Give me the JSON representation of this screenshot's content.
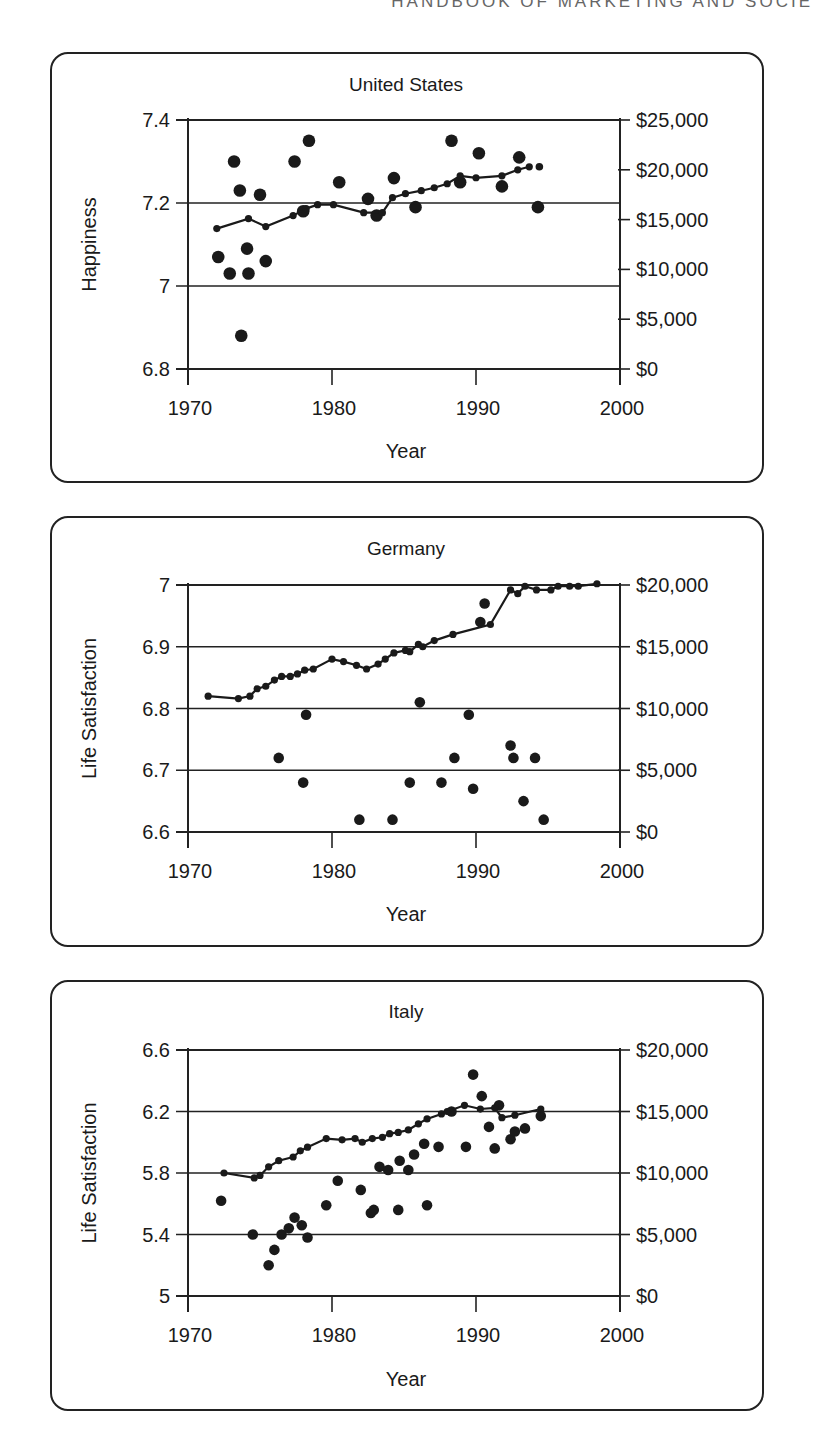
{
  "page": {
    "running_head": "HANDBOOK OF MARKETING AND SOCIE"
  },
  "chart_data": [
    {
      "type": "scatter",
      "title": "United States",
      "xlabel": "Year",
      "ylabel": "Happiness",
      "y2label": "",
      "xlim": [
        1970,
        2000
      ],
      "ylim": [
        6.8,
        7.4
      ],
      "y2lim": [
        0,
        25000
      ],
      "x_ticks": [
        "1970",
        "1980",
        "1990",
        "2000"
      ],
      "y_ticks": [
        "6.8",
        "7",
        "7.2",
        "7.4"
      ],
      "y2_ticks": [
        "$0",
        "$5,000",
        "$10,000",
        "$15,000",
        "$20,000",
        "$25,000"
      ],
      "grid": "horizontal at left-axis ticks",
      "series": [
        {
          "name": "Happiness (survey)",
          "kind": "scatter",
          "axis": "left",
          "x": [
            1972.1,
            1972.9,
            1973.2,
            1973.6,
            1973.7,
            1974.1,
            1974.2,
            1975.0,
            1975.4,
            1977.4,
            1978.0,
            1978.4,
            1980.5,
            1982.5,
            1983.1,
            1984.3,
            1985.8,
            1988.3,
            1988.9,
            1990.2,
            1991.8,
            1993.0,
            1994.3
          ],
          "y": [
            7.07,
            7.03,
            7.3,
            7.23,
            6.88,
            7.09,
            7.03,
            7.22,
            7.06,
            7.3,
            7.18,
            7.35,
            7.25,
            7.21,
            7.17,
            7.26,
            7.19,
            7.35,
            7.25,
            7.32,
            7.24,
            7.31,
            7.19
          ]
        },
        {
          "name": "GNP per capita",
          "kind": "line",
          "axis": "right",
          "x": [
            1972.0,
            1974.2,
            1975.4,
            1977.3,
            1978.2,
            1979.0,
            1980.1,
            1982.2,
            1983.5,
            1984.2,
            1985.1,
            1986.2,
            1987.1,
            1988.0,
            1988.9,
            1990.0,
            1991.8,
            1992.9,
            1993.7
          ],
          "y": [
            14100,
            15100,
            14300,
            15400,
            16100,
            16500,
            16500,
            15700,
            15700,
            17200,
            17600,
            17900,
            18200,
            18600,
            19400,
            19200,
            19400,
            20000,
            20300
          ]
        },
        {
          "name": "GNP per capita (unconnected point)",
          "kind": "scatter-small",
          "axis": "right",
          "x": [
            1994.4
          ],
          "y": [
            20300
          ]
        }
      ]
    },
    {
      "type": "scatter",
      "title": "Germany",
      "xlabel": "Year",
      "ylabel": "Life Satisfaction",
      "xlim": [
        1970,
        2000
      ],
      "ylim": [
        6.6,
        7.0
      ],
      "y2lim": [
        0,
        20000
      ],
      "x_ticks": [
        "1970",
        "1980",
        "1990",
        "2000"
      ],
      "y_ticks": [
        "6.6",
        "6.7",
        "6.8",
        "6.9",
        "7"
      ],
      "y2_ticks": [
        "$0",
        "$5,000",
        "$10,000",
        "$15,000",
        "$20,000"
      ],
      "grid": "horizontal at left-axis ticks",
      "series": [
        {
          "name": "Life satisfaction (survey)",
          "kind": "scatter",
          "axis": "left",
          "x": [
            1976.3,
            1978.2,
            1978.0,
            1981.9,
            1984.2,
            1985.4,
            1986.1,
            1987.6,
            1988.5,
            1989.5,
            1989.8,
            1990.3,
            1990.6,
            1992.4,
            1992.6,
            1993.3,
            1994.1,
            1994.7
          ],
          "y": [
            6.72,
            6.79,
            6.68,
            6.62,
            6.62,
            6.68,
            6.81,
            6.68,
            6.72,
            6.79,
            6.67,
            6.94,
            6.97,
            6.74,
            6.72,
            6.65,
            6.72,
            6.62
          ]
        },
        {
          "name": "GNP per capita",
          "kind": "line",
          "axis": "right",
          "x": [
            1971.4,
            1973.5,
            1974.3,
            1974.8,
            1975.4,
            1976.0,
            1976.5,
            1977.1,
            1977.6,
            1978.1,
            1978.7,
            1980.0,
            1980.8,
            1981.7,
            1982.4,
            1983.2,
            1983.7,
            1984.3,
            1985.1,
            1985.4,
            1986.0,
            1986.3,
            1987.1,
            1988.4,
            1991.0,
            1992.4,
            1992.9,
            1993.4,
            1994.2,
            1995.2,
            1995.7,
            1996.5,
            1997.1,
            1998.4
          ],
          "y": [
            11000,
            10800,
            11000,
            11600,
            11800,
            12300,
            12600,
            12600,
            12800,
            13100,
            13200,
            14000,
            13800,
            13500,
            13200,
            13600,
            14000,
            14500,
            14700,
            14600,
            15200,
            15000,
            15500,
            16000,
            16800,
            19600,
            19300,
            19900,
            19600,
            19600,
            19900,
            19900,
            19900,
            20100
          ]
        }
      ]
    },
    {
      "type": "scatter",
      "title": "Italy",
      "xlabel": "Year",
      "ylabel": "Life Satisfaction",
      "xlim": [
        1970,
        2000
      ],
      "ylim": [
        5.0,
        6.6
      ],
      "y2lim": [
        0,
        20000
      ],
      "x_ticks": [
        "1970",
        "1980",
        "1990",
        "2000"
      ],
      "y_ticks": [
        "5",
        "5.4",
        "5.8",
        "6.2",
        "6.6"
      ],
      "y2_ticks": [
        "$0",
        "$5,000",
        "$10,000",
        "$15,000",
        "$20,000"
      ],
      "grid": "horizontal at left-axis ticks",
      "series": [
        {
          "name": "Life satisfaction (survey)",
          "kind": "scatter",
          "axis": "left",
          "x": [
            1972.3,
            1974.5,
            1975.6,
            1976.0,
            1976.5,
            1977.0,
            1977.4,
            1977.9,
            1978.3,
            1979.6,
            1980.4,
            1982.0,
            1982.7,
            1982.9,
            1983.3,
            1983.9,
            1984.6,
            1984.7,
            1985.3,
            1985.7,
            1986.4,
            1986.6,
            1987.4,
            1988.3,
            1989.3,
            1989.8,
            1990.4,
            1990.9,
            1991.3,
            1991.6,
            1992.4,
            1992.7,
            1993.4,
            1994.5
          ],
          "y": [
            5.62,
            5.4,
            5.2,
            5.3,
            5.4,
            5.44,
            5.51,
            5.46,
            5.38,
            5.59,
            5.75,
            5.69,
            5.54,
            5.56,
            5.84,
            5.82,
            5.56,
            5.88,
            5.82,
            5.92,
            5.99,
            5.59,
            5.97,
            6.2,
            5.97,
            6.44,
            6.3,
            6.1,
            5.96,
            6.24,
            6.02,
            6.07,
            6.09,
            6.17
          ]
        },
        {
          "name": "GNP per capita",
          "kind": "line",
          "axis": "right",
          "x": [
            1972.5,
            1974.6,
            1975.0,
            1975.6,
            1976.3,
            1977.3,
            1977.8,
            1978.3,
            1979.6,
            1980.7,
            1981.6,
            1982.1,
            1982.8,
            1983.5,
            1984.0,
            1984.6,
            1985.3,
            1986.0,
            1986.6,
            1987.6,
            1988.0,
            1989.2,
            1990.3,
            1991.3,
            1991.8,
            1992.7,
            1994.5
          ],
          "y": [
            10000,
            9600,
            9800,
            10500,
            11000,
            11300,
            11800,
            12100,
            12800,
            12700,
            12800,
            12500,
            12800,
            12900,
            13200,
            13300,
            13500,
            14000,
            14400,
            14800,
            15000,
            15500,
            15200,
            15300,
            14500,
            14700,
            15200
          ]
        }
      ]
    }
  ]
}
